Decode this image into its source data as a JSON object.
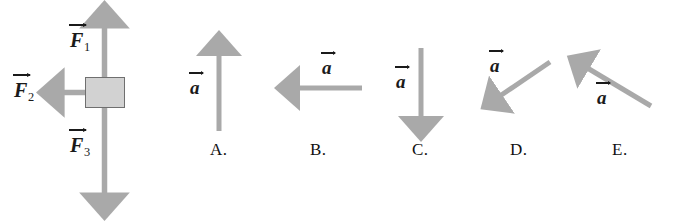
{
  "figure": {
    "type": "physics-free-body-diagram-multiple-choice",
    "colors": {
      "arrow_gray": "#a9a9a9",
      "arrow_gray_dark": "#9a9a9a",
      "box_fill": "#d2d2d2",
      "box_border": "#6f6f6f",
      "text": "#1a1a1a",
      "background": "#ffffff"
    }
  },
  "free_body_diagram": {
    "name": "force-diagram",
    "object": {
      "name": "mass-block",
      "shape": "square"
    },
    "forces": [
      {
        "id": "F1",
        "symbol": "F",
        "subscript": "1",
        "direction": "up",
        "label": "F⃗1",
        "label_position": "left-of-arrow"
      },
      {
        "id": "F2",
        "symbol": "F",
        "subscript": "2",
        "direction": "left",
        "label": "F⃗2",
        "label_position": "left-of-arrow"
      },
      {
        "id": "F3",
        "symbol": "F",
        "subscript": "3",
        "direction": "down",
        "label": "F⃗3",
        "label_position": "left-of-arrow"
      }
    ]
  },
  "options": [
    {
      "letter": "A.",
      "vector_symbol": "a",
      "direction": "up",
      "label_position": "left",
      "angle_degrees": 90
    },
    {
      "letter": "B.",
      "vector_symbol": "a",
      "direction": "left",
      "label_position": "above",
      "angle_degrees": 180
    },
    {
      "letter": "C.",
      "vector_symbol": "a",
      "direction": "down",
      "label_position": "left",
      "angle_degrees": 270
    },
    {
      "letter": "D.",
      "vector_symbol": "a",
      "direction": "down-left",
      "label_position": "above-left",
      "angle_degrees": 215
    },
    {
      "letter": "E.",
      "vector_symbol": "a",
      "direction": "up-left",
      "label_position": "below",
      "angle_degrees": 150
    }
  ]
}
